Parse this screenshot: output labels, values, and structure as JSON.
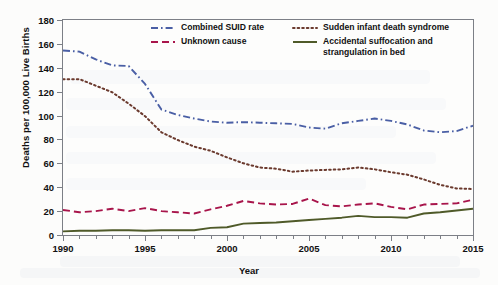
{
  "chart_data": {
    "type": "line",
    "title": "",
    "xlabel": "Year",
    "ylabel": "Deaths per 100,000 Live Births",
    "xlim": [
      1990,
      2015
    ],
    "ylim": [
      0,
      180
    ],
    "yticks": [
      0,
      20,
      40,
      60,
      80,
      100,
      120,
      140,
      160,
      180
    ],
    "xticks": [
      1990,
      1995,
      2000,
      2005,
      2010,
      2015
    ],
    "x_minor_tick_step": 1,
    "grid": false,
    "legend_position": "top-inside",
    "x": [
      1990,
      1991,
      1992,
      1993,
      1994,
      1995,
      1996,
      1997,
      1998,
      1999,
      2000,
      2001,
      2002,
      2003,
      2004,
      2005,
      2006,
      2007,
      2008,
      2009,
      2010,
      2011,
      2012,
      2013,
      2014,
      2015
    ],
    "series": [
      {
        "name": "Combined SUID rate",
        "color": "#4a5fa5",
        "style": "dash-dot",
        "values": [
          154.5,
          153.5,
          147.0,
          142.0,
          141.5,
          126.5,
          105.0,
          100.5,
          97.5,
          95.0,
          94.0,
          94.5,
          94.0,
          93.5,
          93.0,
          90.0,
          89.0,
          93.5,
          95.5,
          97.5,
          95.5,
          92.5,
          87.5,
          86.0,
          87.0,
          91.5
        ],
        "note": "Blue dash-dot line"
      },
      {
        "name": "Sudden infant death syndrome",
        "color": "#6b3a2e",
        "style": "dotted",
        "values": [
          130.5,
          130.5,
          125.0,
          119.5,
          110.0,
          99.5,
          86.0,
          79.5,
          74.0,
          70.5,
          65.0,
          60.0,
          56.5,
          55.5,
          53.0,
          54.0,
          54.5,
          55.0,
          56.5,
          55.0,
          52.5,
          50.5,
          46.5,
          42.0,
          39.0,
          38.5
        ],
        "note": "Brown dotted line"
      },
      {
        "name": "Unknown cause",
        "color": "#a8154b",
        "style": "dashed",
        "values": [
          21.0,
          19.0,
          20.0,
          22.0,
          20.0,
          22.5,
          20.0,
          19.0,
          18.0,
          21.5,
          24.5,
          28.5,
          26.5,
          25.5,
          26.0,
          30.5,
          25.0,
          24.0,
          25.5,
          26.5,
          23.5,
          21.5,
          25.5,
          26.0,
          26.5,
          29.5
        ],
        "note": "Crimson dashed line"
      },
      {
        "name": "Accidental suffocation and strangulation in bed",
        "color": "#4f5a29",
        "style": "solid",
        "values": [
          3.0,
          3.5,
          3.5,
          4.0,
          4.0,
          3.5,
          4.0,
          4.0,
          4.0,
          6.0,
          6.5,
          9.5,
          10.0,
          10.5,
          11.5,
          12.5,
          13.5,
          14.5,
          16.0,
          15.0,
          15.0,
          14.5,
          18.0,
          19.0,
          20.5,
          22.0
        ],
        "note": "Dark olive solid line"
      }
    ]
  },
  "axes": {
    "ylabel": "Deaths per 100,000 Live Births",
    "xlabel": "Year",
    "ytick_labels": [
      "0",
      "20",
      "40",
      "60",
      "80",
      "100",
      "120",
      "140",
      "160",
      "180"
    ],
    "xtick_labels": [
      "1990",
      "1995",
      "2000",
      "2005",
      "2010",
      "2015"
    ]
  },
  "legend": {
    "items": [
      {
        "label": "Combined SUID rate",
        "color": "#4a5fa5",
        "style": "dash-dot"
      },
      {
        "label": "Sudden infant death syndrome",
        "color": "#6b3a2e",
        "style": "dotted"
      },
      {
        "label": "Unknown cause",
        "color": "#a8154b",
        "style": "dashed"
      },
      {
        "label": "Accidental suffocation and\nstrangulation in bed",
        "color": "#4f5a29",
        "style": "solid"
      }
    ]
  }
}
